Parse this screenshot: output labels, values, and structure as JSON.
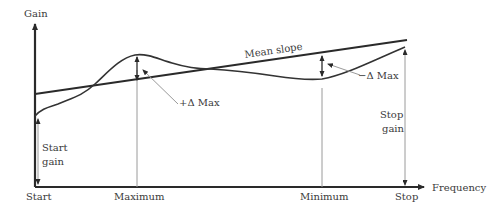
{
  "diagram": {
    "type": "gain-vs-frequency annotated curve",
    "axes": {
      "y_label": "Gain",
      "x_label": "Frequency"
    },
    "x_markers": [
      {
        "label": "Start",
        "x": 35
      },
      {
        "label": "Maximum",
        "x": 137
      },
      {
        "label": "Minimum",
        "x": 322
      },
      {
        "label": "Stop",
        "x": 405
      }
    ],
    "annotations": {
      "mean_slope": "Mean slope",
      "plus_delta_max": "+Δ Max",
      "minus_delta_max": "−Δ Max",
      "start_gain_line1": "Start",
      "start_gain_line2": "gain",
      "stop_gain_line1": "Stop",
      "stop_gain_line2": "gain"
    },
    "colors": {
      "axis": "#2a2a2a",
      "curve": "#333333",
      "guide": "#9a9a9a",
      "text": "#3a3a3a"
    }
  }
}
